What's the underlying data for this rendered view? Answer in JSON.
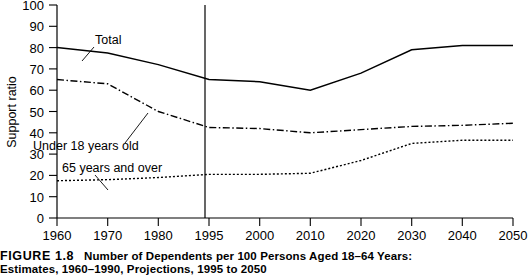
{
  "figure": {
    "number_label": "FIGURE 1.8",
    "caption_line1": "Number of Dependents per 100 Persons Aged 18–64 Years:",
    "caption_line2": "Estimates, 1960–1990, Projections, 1995 to 2050"
  },
  "chart_data": {
    "type": "line",
    "title": "",
    "xlabel": "",
    "ylabel": "Support ratio",
    "ylim": [
      0,
      100
    ],
    "yticks": [
      0,
      10,
      20,
      30,
      40,
      50,
      60,
      70,
      80,
      90,
      100
    ],
    "grid": false,
    "legend": "inline-annotations",
    "categories": [
      "1960",
      "1970",
      "1980",
      "1995",
      "2000",
      "2010",
      "2020",
      "2030",
      "2040",
      "2050"
    ],
    "annotations": [
      {
        "label": "Total",
        "series": "Total"
      },
      {
        "label": "Under 18 years old",
        "series": "Under 18 years old"
      },
      {
        "label": "65 years and over",
        "series": "65 years and over"
      },
      {
        "label": "1995 projection divider",
        "at_x": "1995"
      }
    ],
    "series": [
      {
        "name": "Total",
        "style": "solid",
        "values": [
          80,
          77.5,
          72,
          65,
          64,
          60,
          68,
          79,
          81,
          81
        ]
      },
      {
        "name": "Under 18 years old",
        "style": "dash-dot",
        "values": [
          65,
          63,
          50,
          42.5,
          42,
          40,
          41.5,
          43,
          43.5,
          44.5
        ]
      },
      {
        "name": "65 years and over",
        "style": "dotted",
        "values": [
          17.5,
          18,
          19,
          20.5,
          20.5,
          21,
          27,
          35,
          36.5,
          36.5
        ]
      }
    ]
  },
  "axis": {
    "y_tick_labels": [
      "100",
      "90",
      "80",
      "70",
      "60",
      "50",
      "40",
      "30",
      "20",
      "10",
      "0"
    ],
    "x_tick_labels": [
      "1960",
      "1970",
      "1980",
      "1995",
      "2000",
      "2010",
      "2020",
      "2030",
      "2040",
      "2050"
    ],
    "y_title": "Support ratio"
  },
  "labels": {
    "total": "Total",
    "under18": "Under 18 years old",
    "over65": "65 years and over"
  }
}
